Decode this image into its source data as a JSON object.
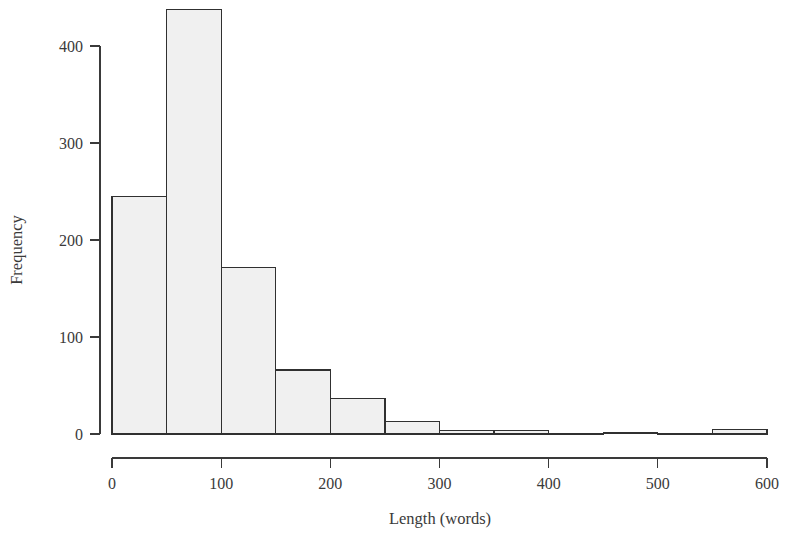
{
  "chart_data": {
    "type": "bar",
    "title": "",
    "subtitle": "",
    "xlabel": "Length (words)",
    "ylabel": "Frequency",
    "xlim": [
      0,
      600
    ],
    "ylim": [
      0,
      440
    ],
    "grid": false,
    "legend": "none",
    "bin_width": 50,
    "x_ticks": [
      0,
      100,
      200,
      300,
      400,
      500,
      600
    ],
    "x_tick_labels": [
      "0",
      "100",
      "200",
      "300",
      "400",
      "500",
      "600"
    ],
    "y_ticks": [
      0,
      100,
      200,
      300,
      400
    ],
    "y_tick_labels": [
      "0",
      "100",
      "200",
      "300",
      "400"
    ],
    "categories": [
      "0-50",
      "50-100",
      "100-150",
      "150-200",
      "200-250",
      "250-300",
      "300-350",
      "350-400",
      "400-450",
      "450-500",
      "500-550",
      "550-600"
    ],
    "bin_edges": [
      0,
      50,
      100,
      150,
      200,
      250,
      300,
      350,
      400,
      450,
      500,
      550,
      600
    ],
    "values": [
      245,
      438,
      172,
      66,
      37,
      13,
      4,
      4,
      0,
      1,
      0,
      5
    ],
    "bar_fill_color": "#f0f0f0",
    "bar_edge_color": "#303030",
    "axis_color": "#3a3a3a",
    "background_color": "#ffffff"
  },
  "figure": {
    "xlabel": "Length (words)",
    "ylabel": "Frequency"
  }
}
